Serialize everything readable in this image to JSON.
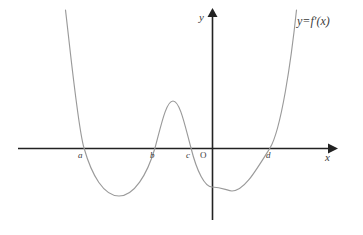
{
  "figure": {
    "title": "",
    "background_color": "#ffffff",
    "curve_color": "#9a9a9a",
    "axis_color": "#222222",
    "label_color": "#3a3a3a"
  },
  "labels": {
    "x_axis": "x",
    "y_axis": "y",
    "origin": "O",
    "curve_equation": "y=f′(x)",
    "root_a": "a",
    "root_b": "b",
    "root_c": "c",
    "root_d": "d"
  },
  "chart_data": {
    "type": "line",
    "title": "",
    "xlabel": "x",
    "ylabel": "y",
    "grid": false,
    "legend": "none",
    "annotations": [
      "y=f′(x)",
      "a",
      "b",
      "c",
      "d",
      "O"
    ],
    "axis_labels_on_axis": [
      "a",
      "b",
      "c",
      "O",
      "d"
    ],
    "x_axis_pixel_y": 148,
    "y_axis_pixel_x": 212,
    "roots": [
      {
        "label": "a",
        "x_px": 84,
        "sign_change": "positive-to-negative"
      },
      {
        "label": "b",
        "x_px": 155,
        "sign_change": "negative-to-positive"
      },
      {
        "label": "c",
        "x_px": 191,
        "sign_change": "positive-to-negative"
      },
      {
        "label": "d",
        "x_px": 270,
        "sign_change": "negative-to-positive"
      }
    ],
    "extrema": [
      {
        "type": "local-min",
        "x_px": 119,
        "y_px": 196
      },
      {
        "type": "local-max",
        "x_px": 173,
        "y_px": 101
      },
      {
        "type": "local-min",
        "x_px": 232,
        "y_px": 191
      }
    ],
    "y_intercept": {
      "x_px": 212,
      "y_px": 187
    },
    "curve_path": "M 65.5,10 C 70,48 78,128 84,148 C 92,176 104,196 119,196 C 134,196 147,175 155,148 C 161,126 166,101 173,101 C 180,101 185,126 191,148 C 197,172 205,187 212,187 C 222,187 228,191 232,191 C 244,191 255,172 270,148 C 281,130 291,62 296.5,10",
    "x_axis_path": "M 18,148.5 L 328,148.5",
    "y_axis_path": "M 212.5,220 L 212.5,17",
    "x_range_px": [
      18,
      336
    ],
    "y_range_px": [
      10,
      225
    ]
  },
  "label_positions": {
    "root_a": {
      "left": 78,
      "top": 151
    },
    "root_b": {
      "left": 150,
      "top": 151
    },
    "root_c": {
      "left": 186,
      "top": 151
    },
    "origin": {
      "left": 200,
      "top": 151
    },
    "root_d": {
      "left": 266,
      "top": 151
    },
    "x_axis": {
      "left": 325,
      "top": 152
    },
    "y_axis": {
      "left": 199,
      "top": 12
    },
    "curve_equation": {
      "left": 297,
      "top": 15
    }
  }
}
